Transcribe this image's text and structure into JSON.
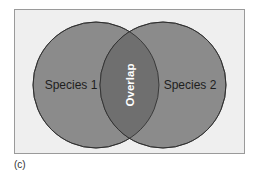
{
  "diagram": {
    "type": "venn",
    "caption": "(c)",
    "sets": [
      {
        "id": "left",
        "label": "Species 1"
      },
      {
        "id": "right",
        "label": "Species 2"
      }
    ],
    "intersection": {
      "label": "Overlap",
      "orientation": "vertical"
    }
  },
  "colors": {
    "page_background": "#ffffff",
    "frame_background": "#efefef",
    "frame_border": "#9a9a9a",
    "circle_fill": "#8b8b8b",
    "overlap_fill": "#6f6f6f",
    "circle_stroke": "#2a2a2a",
    "set_label_color": "#1e1e1e",
    "overlap_label_color": "#ffffff"
  }
}
